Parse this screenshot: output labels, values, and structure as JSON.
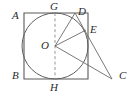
{
  "figure": {
    "background_color": "#ffffff",
    "stroke_color": "#555555",
    "label_color": "#2b2b2b",
    "labels": {
      "A": "A",
      "B": "B",
      "C": "C",
      "D": "D",
      "E": "E",
      "G": "G",
      "H": "H",
      "O": "O"
    },
    "points": {
      "A": {
        "x": 24,
        "y": 13,
        "label_x": 12,
        "label_y": 10
      },
      "B": {
        "x": 24,
        "y": 79,
        "label_x": 12,
        "label_y": 73
      },
      "C": {
        "x": 112,
        "y": 79,
        "label_x": 120,
        "label_y": 73
      },
      "D": {
        "x": 75,
        "y": 13,
        "label_x": 78,
        "label_y": 10
      },
      "E": {
        "x": 86,
        "y": 30,
        "label_x": 90,
        "label_y": 27
      },
      "G": {
        "x": 55,
        "y": 13,
        "label_x": 50,
        "label_y": 3
      },
      "H": {
        "x": 55,
        "y": 79,
        "label_x": 50,
        "label_y": 82
      },
      "O": {
        "x": 55,
        "y": 46,
        "label_x": 42,
        "label_y": 40
      },
      "square_top_right": {
        "x": 88,
        "y": 13
      },
      "square_bottom_right": {
        "x": 88,
        "y": 79
      }
    },
    "circle": {
      "center_x": 55,
      "center_y": 46,
      "radius": 33
    },
    "segments": [
      {
        "name": "square-outline",
        "from": "A",
        "to": "B"
      },
      {
        "name": "tangent-line-DC",
        "from": "D",
        "to": "C"
      },
      {
        "name": "radius-OD",
        "from": "O",
        "to": "D"
      },
      {
        "name": "radius-OE",
        "from": "O",
        "to": "E"
      },
      {
        "name": "segment-OC",
        "from": "O",
        "to": "C"
      },
      {
        "name": "diameter-GH",
        "from": "G",
        "to": "H",
        "style": "dashed"
      }
    ]
  }
}
